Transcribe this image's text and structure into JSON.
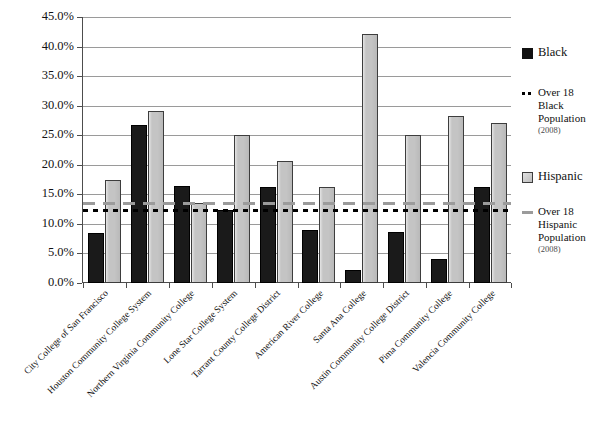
{
  "chart_data": {
    "type": "bar",
    "title": "",
    "xlabel": "",
    "ylabel": "",
    "ylim": [
      0,
      45
    ],
    "ytick_labels": [
      "45.0%",
      "40.0%",
      "35.0%",
      "30.0%",
      "25.0%",
      "20.0%",
      "15.0%",
      "10.0%",
      "5.0%",
      "0.0%"
    ],
    "ytick_values": [
      45,
      40,
      35,
      30,
      25,
      20,
      15,
      10,
      5,
      0
    ],
    "grid": true,
    "legend_position": "right",
    "categories": [
      "City College of San Francisco",
      "Houston Community College System",
      "Northern Virginia Community College",
      "Lone Star College System",
      "Tarrant County College District",
      "American River College",
      "Santa Ana College",
      "Austin Community College District",
      "Pima Community College",
      "Valencia Community College"
    ],
    "series": [
      {
        "name": "Black",
        "color": "#1a1a1a",
        "values": [
          8.4,
          26.7,
          16.4,
          12.3,
          16.2,
          9.0,
          2.2,
          8.7,
          4.0,
          16.2
        ]
      },
      {
        "name": "Hispanic",
        "color": "#c4c4c4",
        "values": [
          17.5,
          29.1,
          13.5,
          25.0,
          20.6,
          16.2,
          42.2,
          25.0,
          28.3,
          27.0
        ]
      }
    ],
    "reference_lines": [
      {
        "name": "Over 18 Black Population (2008)",
        "value": 12.3,
        "style": "dotted",
        "color": "#000000"
      },
      {
        "name": "Over 18 Hispanic Population (2008)",
        "value": 13.5,
        "style": "dashed",
        "color": "#9b9b9b"
      }
    ]
  },
  "legend": {
    "entries": [
      {
        "label": "Black",
        "sub": "",
        "swatch": "sw-black"
      },
      {
        "label": "Over 18 Black Population",
        "sub": "(2008)",
        "swatch": "sw-blackline"
      },
      {
        "label": "Hispanic",
        "sub": "",
        "swatch": "sw-hispanic"
      },
      {
        "label": "Over 18 Hispanic Population",
        "sub": "(2008)",
        "swatch": "sw-hispline"
      }
    ]
  }
}
